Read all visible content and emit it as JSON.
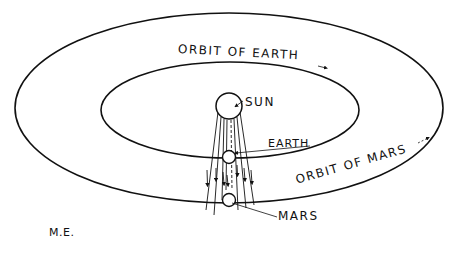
{
  "diagram": {
    "labels": {
      "orbit_earth": "ORBIT OF EARTH",
      "orbit_mars": "ORBIT OF MARS",
      "sun": "SUN",
      "earth": "EARTH",
      "mars": "MARS",
      "initials": "M.E."
    },
    "colors": {
      "ink": "#111111",
      "background": "#ffffff"
    },
    "bodies": [
      {
        "name": "Sun",
        "cx": 229,
        "cy": 106,
        "r": 13
      },
      {
        "name": "Earth",
        "cx": 229,
        "cy": 157,
        "r": 6
      },
      {
        "name": "Mars",
        "cx": 229,
        "cy": 200,
        "r": 6
      }
    ],
    "orbits": [
      {
        "name": "Orbit of Earth",
        "cx": 230,
        "cy": 110,
        "rx": 129,
        "ry": 48
      },
      {
        "name": "Orbit of Mars",
        "cx": 229,
        "cy": 107,
        "rx": 214,
        "ry": 95
      }
    ]
  }
}
